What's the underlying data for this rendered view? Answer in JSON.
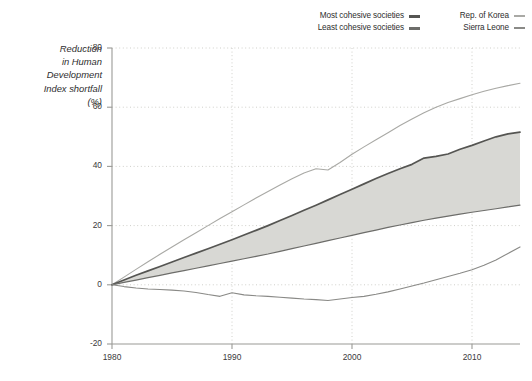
{
  "chart_data": {
    "type": "line",
    "title": "",
    "subtitle": "",
    "xlabel": "",
    "ylabel": "Reduction in Human Development Index shortfall (%)",
    "ylabel_lines": [
      "Reduction",
      "in Human",
      "Development",
      "Index shortfall",
      "(%)"
    ],
    "xlim": [
      1980,
      2014
    ],
    "ylim": [
      -20,
      80
    ],
    "xticks": [
      1980,
      1990,
      2000,
      2010
    ],
    "yticks": [
      -20,
      0,
      20,
      40,
      60,
      80
    ],
    "xtick_labels": [
      "1980",
      "1990",
      "2000",
      "2010"
    ],
    "ytick_labels": [
      "-20",
      "0",
      "20",
      "40",
      "60",
      "80"
    ],
    "grid": "dotted-both",
    "legend_position": "top-right",
    "band_between": [
      "Most cohesive societies",
      "Least cohesive societies"
    ],
    "band_color": "#d8d8d4",
    "x": [
      1980,
      1981,
      1982,
      1983,
      1984,
      1985,
      1986,
      1987,
      1988,
      1989,
      1990,
      1991,
      1992,
      1993,
      1994,
      1995,
      1996,
      1997,
      1998,
      1999,
      2000,
      2001,
      2002,
      2003,
      2004,
      2005,
      2006,
      2007,
      2008,
      2009,
      2010,
      2011,
      2012,
      2013,
      2014
    ],
    "series": [
      {
        "name": "Rep. of Korea",
        "color": "#a9a9a5",
        "width": 1.1,
        "values": [
          0,
          2.6,
          5.2,
          7.8,
          10.3,
          12.8,
          15.2,
          17.6,
          20.0,
          22.4,
          24.7,
          27.0,
          29.3,
          31.5,
          33.7,
          35.8,
          37.8,
          39.2,
          38.8,
          41.3,
          44.1,
          46.6,
          49.0,
          51.4,
          53.8,
          56.0,
          58.1,
          60.0,
          61.6,
          62.9,
          64.2,
          65.4,
          66.4,
          67.3,
          68.1
        ]
      },
      {
        "name": "Most cohesive societies",
        "color": "#555552",
        "width": 1.7,
        "values": [
          0,
          1.6,
          3.2,
          4.7,
          6.2,
          7.7,
          9.2,
          10.7,
          12.2,
          13.7,
          15.2,
          16.8,
          18.4,
          20.0,
          21.7,
          23.4,
          25.2,
          26.9,
          28.7,
          30.5,
          32.3,
          34.1,
          35.9,
          37.6,
          39.2,
          40.7,
          42.8,
          43.4,
          44.2,
          45.8,
          47.1,
          48.6,
          50.0,
          51.0,
          51.6
        ]
      },
      {
        "name": "Least cohesive societies",
        "color": "#6d6d6a",
        "width": 1.2,
        "values": [
          0,
          0.8,
          1.6,
          2.4,
          3.2,
          4.0,
          4.8,
          5.6,
          6.4,
          7.2,
          8.0,
          8.8,
          9.6,
          10.4,
          11.3,
          12.2,
          13.1,
          14.0,
          14.9,
          15.8,
          16.7,
          17.6,
          18.5,
          19.4,
          20.2,
          21.0,
          21.8,
          22.5,
          23.2,
          23.9,
          24.5,
          25.1,
          25.7,
          26.3,
          26.9
        ]
      },
      {
        "name": "Sierra Leone",
        "color": "#8a8a87",
        "width": 1.1,
        "values": [
          0,
          -0.6,
          -1.1,
          -1.4,
          -1.6,
          -1.8,
          -2.1,
          -2.6,
          -3.3,
          -3.9,
          -2.7,
          -3.4,
          -3.7,
          -3.9,
          -4.2,
          -4.5,
          -4.8,
          -5.0,
          -5.3,
          -4.8,
          -4.3,
          -3.9,
          -3.2,
          -2.4,
          -1.4,
          -0.4,
          0.6,
          1.7,
          2.8,
          3.9,
          5.1,
          6.6,
          8.4,
          10.6,
          12.8
        ]
      }
    ]
  },
  "legend": {
    "entries": [
      {
        "label": "Most cohesive societies",
        "marker": "thick",
        "color": "#555552",
        "column": "left",
        "row": 0
      },
      {
        "label": "Rep. of Korea",
        "marker": "thin",
        "color": "#a9a9a5",
        "column": "right",
        "row": 0
      },
      {
        "label": "Least cohesive societies",
        "marker": "thick",
        "color": "#6d6d6a",
        "column": "left",
        "row": 1
      },
      {
        "label": "Sierra Leone",
        "marker": "thin",
        "color": "#8a8a87",
        "column": "right",
        "row": 1
      }
    ]
  },
  "colors": {
    "background": "#ffffff",
    "axis": "#9a9a96",
    "grid": "#cfcfca",
    "text": "#2e2e2e",
    "band": "#d8d8d4"
  }
}
